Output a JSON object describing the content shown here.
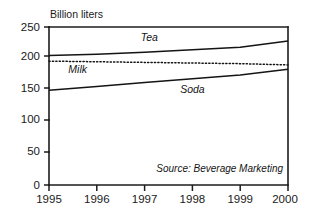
{
  "chart_data": {
    "type": "line",
    "title": "",
    "subtitle": "",
    "unit_label": "Billion liters",
    "xlabel": "",
    "ylabel": "",
    "x": [
      1995,
      1996,
      1997,
      1998,
      1999,
      2000
    ],
    "xtick_labels": [
      "1995",
      "1996",
      "1997",
      "1998",
      "1999",
      "2000"
    ],
    "ytick_labels": [
      "0",
      "50",
      "100",
      "150",
      "200",
      "250"
    ],
    "ytick_values": [
      0,
      50,
      100,
      150,
      200,
      250
    ],
    "ylim": [
      0,
      250
    ],
    "xlim": [
      1995,
      2000
    ],
    "grid": false,
    "legend_position": "inline-annotations",
    "series": [
      {
        "name": "Tea",
        "style": "solid",
        "color": "#141414",
        "values": [
          205,
          207,
          210,
          214,
          218,
          228
        ],
        "label_x": 1997.1,
        "label_y": 228
      },
      {
        "name": "Milk",
        "style": "dotted",
        "color": "#141414",
        "values": [
          196,
          195,
          194,
          193,
          192,
          190
        ],
        "label_x": 1995.6,
        "label_y": 178
      },
      {
        "name": "Soda",
        "style": "solid",
        "color": "#141414",
        "values": [
          150,
          156,
          162,
          168,
          174,
          183
        ],
        "label_x": 1998.0,
        "label_y": 146
      }
    ],
    "annotations": [
      {
        "text": "Source: Beverage Marketing",
        "align": "right"
      }
    ]
  },
  "colors": {
    "axis": "#1c1c1c",
    "ink": "#141414",
    "background": "#ffffff"
  }
}
